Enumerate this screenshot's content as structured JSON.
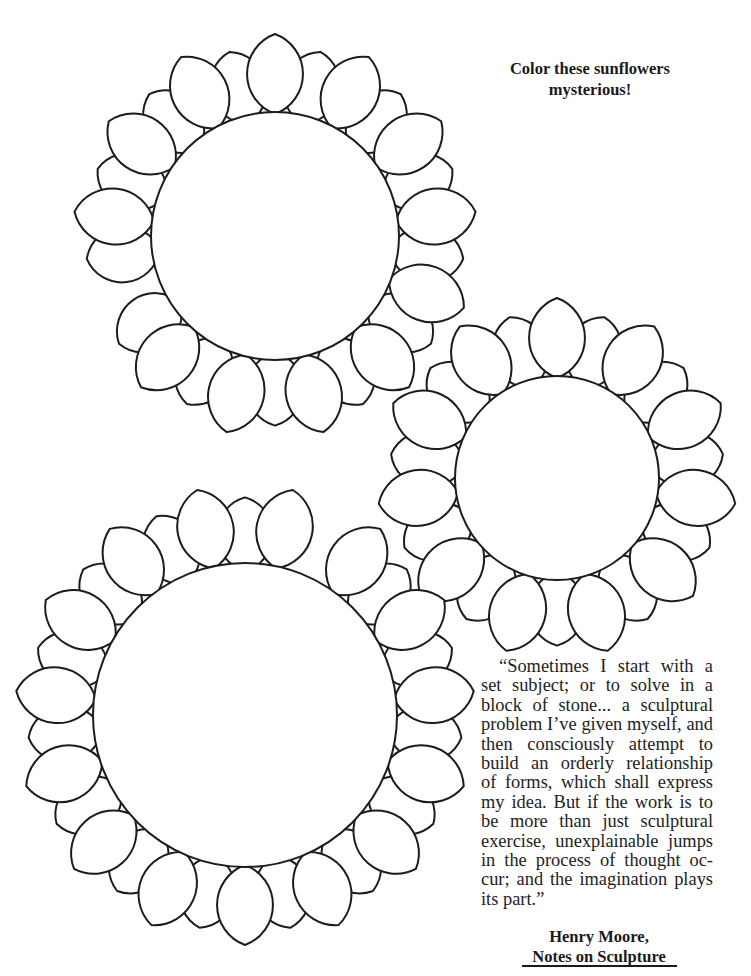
{
  "page": {
    "background": "#ffffff",
    "ink_color": "#1c1c1c"
  },
  "heading": {
    "line1": "Color these sunflowers",
    "line2": "mysterious!"
  },
  "quote": {
    "lines": [
      "“Sometimes I start with a",
      "set subject; or to solve in a",
      "block of stone... a sculptural",
      "problem I’ve given myself, and",
      "then consciously attempt to",
      "build an orderly relationship",
      "of forms, which shall express",
      "my idea. But if the work is to",
      "be more than just sculptural",
      "exercise, unexplainable jumps",
      "in the process of thought oc-",
      "cur; and the imagination plays",
      "its part.”"
    ]
  },
  "attribution": {
    "author": "Henry Moore,",
    "source": "Notes on Sculpture"
  },
  "flowers": [
    {
      "name": "sunflower-top-left",
      "cx": 275,
      "cy": 236,
      "r": 124,
      "petal_count": 26,
      "petal_length": 80,
      "petal_width": 56,
      "rotation_deg": -90,
      "gaps_deg": [
        165,
        180
      ]
    },
    {
      "name": "sunflower-right",
      "cx": 557,
      "cy": 478,
      "r": 102,
      "petal_count": 22,
      "petal_length": 80,
      "petal_width": 56,
      "rotation_deg": -90,
      "gaps_deg": []
    },
    {
      "name": "sunflower-bottom-left",
      "cx": 245,
      "cy": 715,
      "r": 152,
      "petal_count": 30,
      "petal_length": 80,
      "petal_width": 56,
      "rotation_deg": 90,
      "gaps_deg": [
        -62
      ]
    }
  ]
}
